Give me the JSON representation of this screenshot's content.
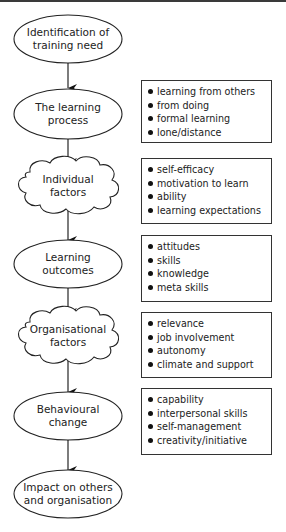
{
  "diagram": {
    "type": "flowchart",
    "nodes": [
      {
        "id": "n1",
        "shape": "ellipse",
        "line1": "Identification of",
        "line2": "training need"
      },
      {
        "id": "n2",
        "shape": "ellipse",
        "line1": "The learning",
        "line2": "process"
      },
      {
        "id": "n3",
        "shape": "cloud",
        "line1": "Individual",
        "line2": "factors"
      },
      {
        "id": "n4",
        "shape": "ellipse",
        "line1": "Learning",
        "line2": "outcomes"
      },
      {
        "id": "n5",
        "shape": "cloud",
        "line1": "Organisational",
        "line2": "factors"
      },
      {
        "id": "n6",
        "shape": "ellipse",
        "line1": "Behavioural",
        "line2": "change"
      },
      {
        "id": "n7",
        "shape": "ellipse",
        "line1": "Impact on others",
        "line2": "and organisation"
      }
    ],
    "edges": [
      {
        "from": "n1",
        "to": "n2"
      },
      {
        "from": "n2",
        "to": "n3"
      },
      {
        "from": "n3",
        "to": "n4"
      },
      {
        "from": "n4",
        "to": "n5"
      },
      {
        "from": "n5",
        "to": "n6"
      },
      {
        "from": "n6",
        "to": "n7"
      }
    ],
    "boxes": [
      {
        "attached_to": "n2",
        "items": [
          "learning from others",
          "from doing",
          "formal learning",
          "lone/distance"
        ]
      },
      {
        "attached_to": "n3",
        "items": [
          "self-efficacy",
          "motivation to learn",
          "ability",
          "learning expectations"
        ]
      },
      {
        "attached_to": "n4",
        "items": [
          "attitudes",
          "skills",
          "knowledge",
          "meta skills"
        ]
      },
      {
        "attached_to": "n5",
        "items": [
          "relevance",
          "job involvement",
          "autonomy",
          "climate and support"
        ]
      },
      {
        "attached_to": "n6",
        "items": [
          "capability",
          "interpersonal skills",
          "self-management",
          "creativity/initiative"
        ]
      }
    ],
    "colors": {
      "stroke": "#222222",
      "background": "#ffffff"
    }
  }
}
